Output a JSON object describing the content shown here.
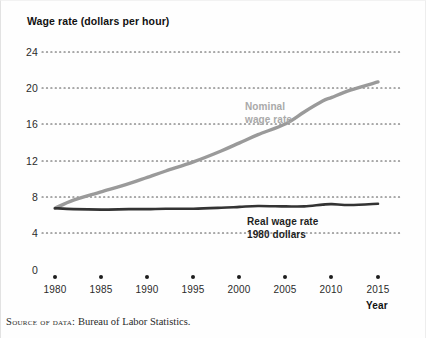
{
  "figure": {
    "title": "Wage rate (dollars per hour)",
    "x_axis_title": "Year",
    "source_note_caps": "Source of data:",
    "source_note_rest": " Bureau of Labor Statistics."
  },
  "colors": {
    "nominal_line": "#9a9a9a",
    "real_line": "#333333",
    "gridline": "#555555",
    "axis_text": "#2b2b2b",
    "background": "#ffffff"
  },
  "chart_data": {
    "type": "line",
    "title": "Wage rate (dollars per hour)",
    "xlabel": "Year",
    "ylabel": "Wage rate (dollars per hour)",
    "xlim": [
      1980,
      2015
    ],
    "ylim": [
      0,
      24
    ],
    "yticks": [
      0,
      4,
      8,
      12,
      16,
      20,
      24
    ],
    "xticks": [
      1980,
      1985,
      1990,
      1995,
      2000,
      2005,
      2010,
      2015
    ],
    "grid": "horizontal-dotted",
    "legend": "inline-annotations",
    "x": [
      1980,
      1982,
      1985,
      1988,
      1990,
      1992,
      1995,
      1998,
      2000,
      2002,
      2005,
      2007,
      2009,
      2010,
      2012,
      2015
    ],
    "series": [
      {
        "name": "Nominal wage rate",
        "color": "#9a9a9a",
        "values": [
          6.8,
          7.7,
          8.6,
          9.5,
          10.2,
          10.9,
          11.9,
          13.1,
          14.0,
          14.9,
          16.1,
          17.4,
          18.6,
          19.0,
          19.8,
          20.7
        ]
      },
      {
        "name": "Real wage rate 1980 dollars",
        "color": "#333333",
        "values": [
          6.8,
          6.7,
          6.65,
          6.7,
          6.7,
          6.75,
          6.75,
          6.85,
          6.95,
          7.05,
          7.0,
          7.0,
          7.2,
          7.25,
          7.15,
          7.3
        ]
      }
    ],
    "annotations": [
      {
        "text_line1": "Nominal",
        "text_line2": "wage rate",
        "x": 2000,
        "y": 17.6,
        "color": "#a9a9a9"
      },
      {
        "text_line1": "Real wage rate",
        "text_line2": "1980 dollars",
        "x": 2005,
        "y": 5.9,
        "color": "#1f1f1f"
      }
    ]
  },
  "y_ticks": [
    {
      "label": "24",
      "top": 46
    },
    {
      "label": "20",
      "top": 82
    },
    {
      "label": "16",
      "top": 118
    },
    {
      "label": "12",
      "top": 155
    },
    {
      "label": "8",
      "top": 191
    },
    {
      "label": "4",
      "top": 227
    },
    {
      "label": "0",
      "top": 264
    }
  ],
  "x_ticks": [
    {
      "label": "1980",
      "left": 55
    },
    {
      "label": "1985",
      "left": 101
    },
    {
      "label": "1990",
      "left": 147
    },
    {
      "label": "1995",
      "left": 193
    },
    {
      "label": "2000",
      "left": 239
    },
    {
      "label": "2005",
      "left": 285
    },
    {
      "label": "2010",
      "left": 331
    },
    {
      "label": "2015",
      "left": 378
    }
  ]
}
